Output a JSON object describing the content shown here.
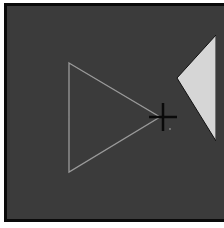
{
  "scene": {
    "background_color": "#3b3b3b",
    "border_color": "#0a0a0a",
    "outer_color": "#ffffff",
    "triangle": {
      "stroke_color": "#9a9a9a",
      "points": [
        [
          69,
          63
        ],
        [
          160,
          117
        ],
        [
          69,
          172
        ]
      ]
    },
    "target_shape": {
      "fill_color": "#d6d6d6",
      "points": [
        [
          177,
          78
        ],
        [
          216,
          35
        ],
        [
          216,
          141
        ]
      ]
    },
    "cursor": {
      "type": "crosshair",
      "color": "#0a0a0a",
      "center": [
        163,
        117
      ],
      "half_width": 14,
      "half_height": 14
    },
    "dot": {
      "color": "#8a8a8a",
      "position": [
        170,
        129
      ]
    }
  }
}
